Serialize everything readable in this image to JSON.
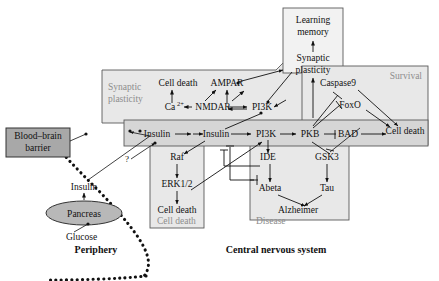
{
  "figure": {
    "type": "biological-signaling-diagram",
    "regions": [
      {
        "id": "periphery",
        "label": "Periphery"
      },
      {
        "id": "cns",
        "label": "Central nervous system"
      }
    ],
    "panels": [
      {
        "id": "synaptic-plasticity-panel",
        "label": "Synaptic plasticity"
      },
      {
        "id": "survival-panel",
        "label": "Survival"
      },
      {
        "id": "cell-death-panel",
        "label": "Cell death"
      },
      {
        "id": "disease-panel",
        "label": "Disease"
      }
    ],
    "nodes": {
      "learning_memory_1": "Learning",
      "learning_memory_2": "memory",
      "synaptic_plasticity_1": "Synaptic",
      "synaptic_plasticity_2": "plasticity",
      "cell_death_top": "Cell death",
      "ampar": "AMPAR",
      "calcium": "Ca",
      "calcium_sup": "2+",
      "nmdar": "NMDAR",
      "pi3k_top": "PI3K",
      "caspase9": "Caspase9",
      "foxo": "FoxO",
      "cell_death_survival": "Cell death",
      "insulin_band_left": "Insulin",
      "insulin_band_right": "Insulin",
      "pi3k_band": "PI3K",
      "pkb": "PKB",
      "bad": "BAD",
      "raf": "Raf",
      "erk12": "ERK1/2",
      "cell_death_left": "Cell death",
      "ide": "IDE",
      "abeta": "Abeta",
      "gsk3": "GSK3",
      "tau": "Tau",
      "alzheimer": "Alzheimer",
      "blood_brain_barrier_1": "Blood–brain",
      "blood_brain_barrier_2": "barrier",
      "insulin_periphery": "Insulin",
      "pancreas": "Pancreas",
      "glucose": "Glucose",
      "question_mark": "?"
    },
    "panel_labels": {
      "synaptic_plasticity_1": "Synaptic",
      "synaptic_plasticity_2": "plasticity",
      "survival": "Survival",
      "cell_death": "Cell death",
      "disease": "Disease"
    },
    "colors": {
      "panel_fill": "#e8e8e8",
      "band_fill": "#d6d6d6",
      "bbb_fill": "#a8a8a8",
      "pancreas_fill": "#b8b8b8",
      "panel_label_text": "#8d8d8d",
      "stroke": "#111111",
      "background": "#ffffff"
    }
  }
}
